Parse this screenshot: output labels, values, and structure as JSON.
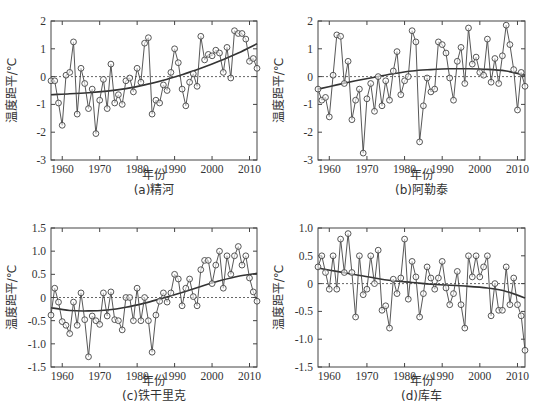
{
  "chart_data": [
    {
      "id": "a",
      "type": "line",
      "caption": "(a)精河",
      "xlabel": "年份",
      "ylabel": "温度距平/℃",
      "xlim": [
        1957,
        2012
      ],
      "ylim": [
        -3,
        2
      ],
      "xticks": [
        1960,
        1970,
        1980,
        1990,
        2000,
        2010
      ],
      "yticks": [
        2,
        1,
        0,
        -1,
        -2,
        -3
      ],
      "ytick_labels": [
        "2",
        "1",
        "0",
        "-1",
        "-2",
        "-3"
      ],
      "reference_line": 0,
      "x": [
        1957,
        1958,
        1959,
        1960,
        1961,
        1962,
        1963,
        1964,
        1965,
        1966,
        1967,
        1968,
        1969,
        1970,
        1971,
        1972,
        1973,
        1974,
        1975,
        1976,
        1977,
        1978,
        1979,
        1980,
        1981,
        1982,
        1983,
        1984,
        1985,
        1986,
        1987,
        1988,
        1989,
        1990,
        1991,
        1992,
        1993,
        1994,
        1995,
        1996,
        1997,
        1998,
        1999,
        2000,
        2001,
        2002,
        2003,
        2004,
        2005,
        2006,
        2007,
        2008,
        2009,
        2010,
        2011,
        2012
      ],
      "series": [
        {
          "name": "温度距平",
          "values": [
            -0.15,
            -0.15,
            -0.95,
            -1.75,
            0.05,
            0.15,
            1.25,
            -1.35,
            0.3,
            -0.25,
            -1.15,
            -0.45,
            -2.05,
            -0.85,
            -0.1,
            -1.15,
            0.45,
            -0.95,
            -0.65,
            -1.0,
            -0.15,
            -0.05,
            -0.55,
            0.3,
            -0.2,
            1.2,
            1.4,
            -1.35,
            -0.85,
            -0.95,
            -0.3,
            -0.5,
            0.15,
            1.0,
            0.5,
            -0.45,
            -1.05,
            -0.2,
            0.1,
            -0.35,
            1.45,
            0.6,
            0.8,
            0.75,
            0.95,
            0.85,
            0.15,
            1.05,
            -0.05,
            1.65,
            1.55,
            1.55,
            1.35,
            0.55,
            0.65,
            0.3
          ]
        },
        {
          "name": "趋势线",
          "x": [
            1957,
            1962,
            1967,
            1972,
            1977,
            1982,
            1987,
            1992,
            1997,
            2002,
            2007,
            2012
          ],
          "values": [
            -0.65,
            -0.62,
            -0.58,
            -0.52,
            -0.43,
            -0.3,
            -0.13,
            0.07,
            0.3,
            0.56,
            0.85,
            1.18
          ]
        }
      ]
    },
    {
      "id": "b",
      "type": "line",
      "caption": "(b)阿勒泰",
      "xlabel": "年份",
      "ylabel": "温度距平/℃",
      "xlim": [
        1957,
        2012
      ],
      "ylim": [
        -3,
        2
      ],
      "xticks": [
        1960,
        1970,
        1980,
        1990,
        2000,
        2010
      ],
      "yticks": [
        2,
        1,
        0,
        -1,
        -2,
        -3
      ],
      "ytick_labels": [
        "2",
        "1",
        "0",
        "-1",
        "-2",
        "-3"
      ],
      "reference_line": 0,
      "x": [
        1957,
        1958,
        1959,
        1960,
        1961,
        1962,
        1963,
        1964,
        1965,
        1966,
        1967,
        1968,
        1969,
        1970,
        1971,
        1972,
        1973,
        1974,
        1975,
        1976,
        1977,
        1978,
        1979,
        1980,
        1981,
        1982,
        1983,
        1984,
        1985,
        1986,
        1987,
        1988,
        1989,
        1990,
        1991,
        1992,
        1993,
        1994,
        1995,
        1996,
        1997,
        1998,
        1999,
        2000,
        2001,
        2002,
        2003,
        2004,
        2005,
        2006,
        2007,
        2008,
        2009,
        2010,
        2011,
        2012
      ],
      "series": [
        {
          "name": "温度距平",
          "values": [
            -0.45,
            -0.85,
            -0.75,
            -1.45,
            0.05,
            1.5,
            1.45,
            -0.25,
            0.55,
            -1.55,
            -0.85,
            -0.45,
            -2.75,
            -0.8,
            -0.25,
            -1.25,
            0.0,
            -1.05,
            -0.15,
            -0.85,
            0.2,
            0.9,
            -0.65,
            -0.15,
            0.0,
            1.65,
            1.25,
            -2.35,
            -1.05,
            -0.05,
            -0.55,
            -0.45,
            1.25,
            1.15,
            0.85,
            -0.05,
            -0.85,
            0.55,
            1.05,
            -0.25,
            1.75,
            0.45,
            0.7,
            0.15,
            0.05,
            1.35,
            -0.2,
            0.65,
            -0.25,
            0.75,
            1.85,
            1.15,
            0.25,
            -1.2,
            0.15,
            -0.35
          ]
        },
        {
          "name": "趋势线",
          "x": [
            1957,
            1962,
            1967,
            1972,
            1977,
            1982,
            1987,
            1992,
            1997,
            2002,
            2007,
            2012
          ],
          "values": [
            -0.45,
            -0.3,
            -0.15,
            -0.02,
            0.1,
            0.2,
            0.25,
            0.28,
            0.28,
            0.26,
            0.2,
            0.05
          ]
        }
      ]
    },
    {
      "id": "c",
      "type": "line",
      "caption": "(c)铁干里克",
      "xlabel": "年份",
      "ylabel": "温度距平/℃",
      "xlim": [
        1957,
        2012
      ],
      "ylim": [
        -1.5,
        1.5
      ],
      "xticks": [
        1960,
        1970,
        1980,
        1990,
        2000,
        2010
      ],
      "yticks": [
        1.5,
        1.0,
        0.5,
        0,
        -0.5,
        -1.0,
        -1.5
      ],
      "ytick_labels": [
        "1.5",
        "1.0",
        "0.5",
        "0",
        "-0.5",
        "-1.0",
        "-1.5"
      ],
      "reference_line": 0,
      "x": [
        1957,
        1958,
        1959,
        1960,
        1961,
        1962,
        1963,
        1964,
        1965,
        1966,
        1967,
        1968,
        1969,
        1970,
        1971,
        1972,
        1973,
        1974,
        1975,
        1976,
        1977,
        1978,
        1979,
        1980,
        1981,
        1982,
        1983,
        1984,
        1985,
        1986,
        1987,
        1988,
        1989,
        1990,
        1991,
        1992,
        1993,
        1994,
        1995,
        1996,
        1997,
        1998,
        1999,
        2000,
        2001,
        2002,
        2003,
        2004,
        2005,
        2006,
        2007,
        2008,
        2009,
        2010,
        2011,
        2012
      ],
      "series": [
        {
          "name": "温度距平",
          "values": [
            -0.38,
            0.2,
            -0.1,
            -0.52,
            -0.6,
            -0.78,
            -0.1,
            -0.6,
            0.1,
            -0.48,
            -1.28,
            -0.4,
            -0.5,
            -0.58,
            0.1,
            -0.4,
            0.12,
            -0.48,
            -0.5,
            -0.7,
            0.0,
            0.0,
            -0.5,
            0.2,
            -0.5,
            0.0,
            -0.5,
            -1.18,
            -0.38,
            -0.08,
            0.1,
            -0.1,
            0.1,
            0.5,
            0.4,
            -0.18,
            0.2,
            0.4,
            0.02,
            -0.18,
            0.6,
            0.8,
            0.8,
            0.3,
            0.7,
            1.0,
            0.2,
            0.9,
            0.5,
            0.9,
            1.1,
            0.7,
            0.9,
            0.42,
            0.12,
            -0.08
          ]
        },
        {
          "name": "趋势线",
          "x": [
            1957,
            1962,
            1967,
            1972,
            1977,
            1982,
            1987,
            1992,
            1997,
            2002,
            2007,
            2012
          ],
          "values": [
            -0.22,
            -0.28,
            -0.29,
            -0.27,
            -0.21,
            -0.12,
            -0.01,
            0.11,
            0.24,
            0.36,
            0.46,
            0.52
          ]
        }
      ]
    },
    {
      "id": "d",
      "type": "line",
      "caption": "(d)库车",
      "xlabel": "年份",
      "ylabel": "温度距平/℃",
      "xlim": [
        1957,
        2012
      ],
      "ylim": [
        -1.5,
        1.0
      ],
      "xticks": [
        1960,
        1970,
        1980,
        1990,
        2000,
        2010
      ],
      "yticks": [
        1.0,
        0.5,
        0,
        -0.5,
        -1.0,
        -1.5
      ],
      "ytick_labels": [
        "1.0",
        "0.5",
        "0",
        "-0.5",
        "-1.0",
        "-1.5"
      ],
      "reference_line": 0,
      "x": [
        1957,
        1958,
        1959,
        1960,
        1961,
        1962,
        1963,
        1964,
        1965,
        1966,
        1967,
        1968,
        1969,
        1970,
        1971,
        1972,
        1973,
        1974,
        1975,
        1976,
        1977,
        1978,
        1979,
        1980,
        1981,
        1982,
        1983,
        1984,
        1985,
        1986,
        1987,
        1988,
        1989,
        1990,
        1991,
        1992,
        1993,
        1994,
        1995,
        1996,
        1997,
        1998,
        1999,
        2000,
        2001,
        2002,
        2003,
        2004,
        2005,
        2006,
        2007,
        2008,
        2009,
        2010,
        2011,
        2012
      ],
      "series": [
        {
          "name": "温度距平",
          "values": [
            0.3,
            0.5,
            0.2,
            -0.1,
            0.5,
            -0.1,
            0.8,
            0.2,
            0.9,
            0.2,
            -0.6,
            0.5,
            -0.2,
            -0.1,
            0.5,
            0.0,
            0.6,
            -0.48,
            -0.4,
            -0.8,
            0.08,
            -0.18,
            0.1,
            0.8,
            -0.28,
            0.4,
            0.12,
            -0.6,
            -0.18,
            0.3,
            0.1,
            -0.1,
            0.1,
            0.4,
            -0.08,
            -0.38,
            -0.18,
            0.22,
            -0.38,
            -0.8,
            0.5,
            0.12,
            0.5,
            0.12,
            0.3,
            0.5,
            -0.58,
            0.0,
            -0.48,
            -0.48,
            0.3,
            -0.38,
            0.1,
            -0.38,
            -0.58,
            -1.2
          ]
        },
        {
          "name": "趋势线",
          "x": [
            1957,
            1962,
            1967,
            1972,
            1977,
            1982,
            1987,
            1992,
            1997,
            2002,
            2007,
            2012
          ],
          "values": [
            0.28,
            0.22,
            0.16,
            0.1,
            0.05,
            0.02,
            -0.01,
            -0.03,
            -0.05,
            -0.08,
            -0.14,
            -0.26
          ]
        }
      ]
    }
  ]
}
